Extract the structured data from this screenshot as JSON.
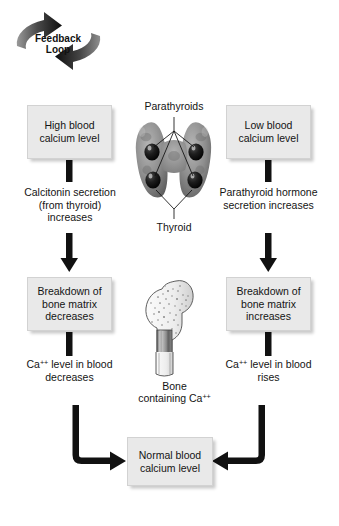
{
  "diagram": {
    "background_color": "#ffffff",
    "box_fill": "#e9e9e9",
    "arrow_color": "#111111"
  },
  "feedback_loop": {
    "line1": "Feedback",
    "line2": "Loop",
    "icon": "circular-arrows-icon"
  },
  "left_branch": {
    "stimulus_box": "High blood calcium level",
    "response_label": "Calcitonin secretion (from thyroid) increases",
    "effect_box": "Breakdown of bone matrix decreases",
    "outcome_label_prefix": "Ca",
    "outcome_label_charge": "++",
    "outcome_label_suffix": " level in blood decreases"
  },
  "right_branch": {
    "stimulus_box": "Low blood calcium level",
    "response_label": "Parathyroid hormone secretion increases",
    "effect_box": "Breakdown of bone matrix increases",
    "outcome_label_prefix": "Ca",
    "outcome_label_charge": "++",
    "outcome_label_suffix": " level in blood rises"
  },
  "result": {
    "box": "Normal blood calcium level"
  },
  "anatomy": {
    "parathyroids_label": "Parathyroids",
    "thyroid_label": "Thyroid",
    "bone_label_line1": "Bone",
    "bone_label_line2_prefix": "containing Ca",
    "bone_label_line2_charge": "++",
    "gland_icon": "thyroid-gland-icon",
    "bone_icon": "femur-bone-icon"
  }
}
